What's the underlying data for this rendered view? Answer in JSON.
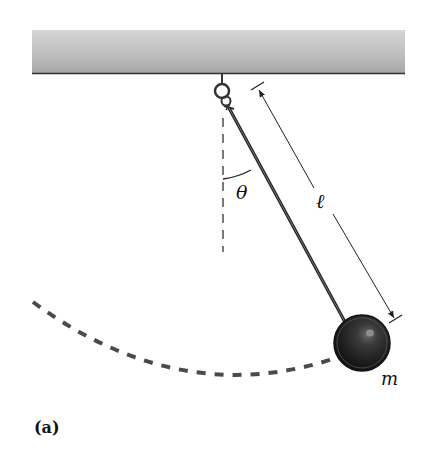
{
  "figure": {
    "label": "(a)",
    "type": "simple pendulum diagram"
  },
  "labels": {
    "angle": "θ",
    "length": "ℓ",
    "mass": "m"
  },
  "colors": {
    "ceiling_light": "#d2d2d2",
    "ceiling_dark": "#a9a9a9",
    "ceiling_edge": "#333333",
    "rod": "#2a2a2a",
    "bob": "#1e1e1e",
    "dashed_arc": "#4a4a4a",
    "lines": "#222222"
  }
}
